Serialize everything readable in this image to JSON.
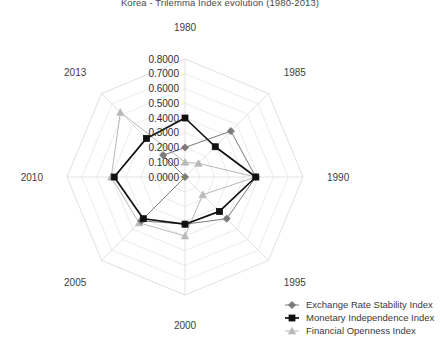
{
  "chart_data": {
    "type": "radar",
    "title": "Korea - Trilemma Index evolution (1980-2013)",
    "xlabel": "",
    "ylabel": "",
    "categories": [
      "1980",
      "1985",
      "1990",
      "1995",
      "2000",
      "2005",
      "2010",
      "2013"
    ],
    "rlim": [
      0.0,
      0.8
    ],
    "r_ticks": [
      "0.0000",
      "0.1000",
      "0.2000",
      "0.3000",
      "0.4000",
      "0.5000",
      "0.6000",
      "0.7000",
      "0.8000"
    ],
    "r_tick_values": [
      0.0,
      0.1,
      0.2,
      0.3,
      0.4,
      0.5,
      0.6,
      0.7,
      0.8
    ],
    "grid": true,
    "legend_position": "bottom-right",
    "series": [
      {
        "name": "Exchange Rate Stability Index",
        "marker": "diamond",
        "color": "#7a7a7a",
        "values": [
          0.2,
          0.44,
          0.48,
          0.4,
          0.32,
          0.42,
          0.0,
          0.21
        ]
      },
      {
        "name": "Monetary Independence Index",
        "marker": "square",
        "color": "#111111",
        "values": [
          0.4,
          0.29,
          0.48,
          0.33,
          0.32,
          0.4,
          0.48,
          0.37
        ]
      },
      {
        "name": "Financial Openness Index",
        "marker": "triangle",
        "color": "#b9b9b9",
        "values": [
          0.1,
          0.13,
          0.48,
          0.17,
          0.4,
          0.44,
          0.5,
          0.62
        ]
      }
    ]
  },
  "legend": {
    "items": [
      {
        "label": "Exchange Rate Stability Index"
      },
      {
        "label": "Monetary Independence Index"
      },
      {
        "label": "Financial Openness Index"
      }
    ]
  }
}
